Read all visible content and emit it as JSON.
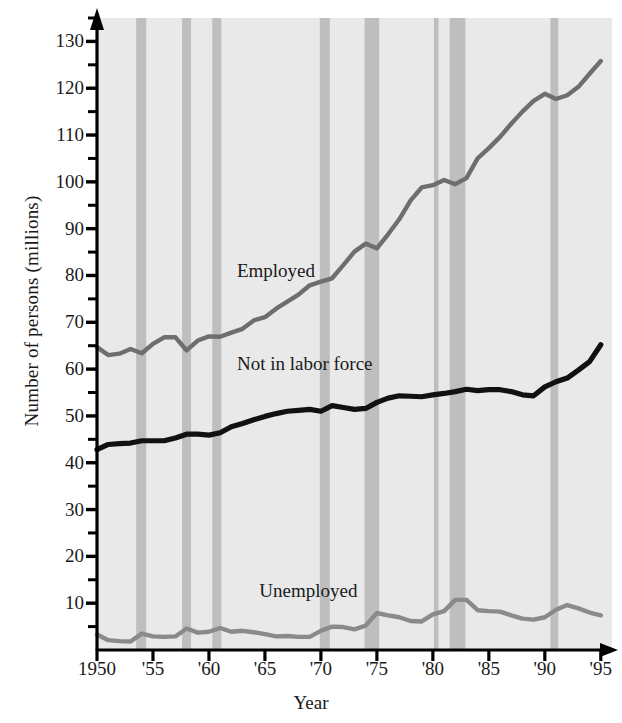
{
  "chart_data": {
    "type": "line",
    "title": "",
    "xlabel": "Year",
    "ylabel": "Number of persons (millions)",
    "xlim": [
      1950,
      1996
    ],
    "ylim": [
      0,
      135
    ],
    "grid": false,
    "legend_position": "inline-annotations",
    "x_tick_labels": [
      "1950",
      "'55",
      "'60",
      "'65",
      "'70",
      "'75",
      "'80",
      "'85",
      "'90",
      "'95"
    ],
    "x_tick_values": [
      1950,
      1955,
      1960,
      1965,
      1970,
      1975,
      1980,
      1985,
      1990,
      1995
    ],
    "y_tick_labels": [
      "10",
      "20",
      "30",
      "40",
      "50",
      "60",
      "70",
      "80",
      "90",
      "100",
      "110",
      "120",
      "130"
    ],
    "y_tick_values": [
      10,
      20,
      30,
      40,
      50,
      60,
      70,
      80,
      90,
      100,
      110,
      120,
      130
    ],
    "y_minor_ticks": [
      5,
      15,
      25,
      35,
      45,
      55,
      65,
      75,
      85,
      95,
      105,
      115,
      125,
      135
    ],
    "x": [
      1950,
      1951,
      1952,
      1953,
      1954,
      1955,
      1956,
      1957,
      1958,
      1959,
      1960,
      1961,
      1962,
      1963,
      1964,
      1965,
      1966,
      1967,
      1968,
      1969,
      1970,
      1971,
      1972,
      1973,
      1974,
      1975,
      1976,
      1977,
      1978,
      1979,
      1980,
      1981,
      1982,
      1983,
      1984,
      1985,
      1986,
      1987,
      1988,
      1989,
      1990,
      1991,
      1992,
      1993,
      1994,
      1995
    ],
    "series": [
      {
        "name": "Employed",
        "color": "#6e6e6e",
        "values": [
          64.7,
          63.0,
          63.3,
          64.3,
          63.4,
          65.4,
          66.8,
          66.8,
          64.0,
          66.1,
          67.0,
          66.9,
          67.8,
          68.6,
          70.4,
          71.1,
          72.9,
          74.4,
          75.9,
          77.9,
          78.7,
          79.4,
          82.2,
          85.1,
          86.8,
          85.8,
          88.8,
          92.0,
          96.0,
          98.8,
          99.3,
          100.4,
          99.5,
          100.8,
          105.0,
          107.2,
          109.6,
          112.4,
          115.0,
          117.3,
          118.8,
          117.7,
          118.5,
          120.3,
          123.1,
          125.8
        ]
      },
      {
        "name": "Not in labor force",
        "color": "#111111",
        "values": [
          42.8,
          43.9,
          44.1,
          44.2,
          44.7,
          44.7,
          44.7,
          45.3,
          46.1,
          46.1,
          45.9,
          46.4,
          47.7,
          48.4,
          49.2,
          49.9,
          50.5,
          51.0,
          51.2,
          51.4,
          51.0,
          52.2,
          51.8,
          51.4,
          51.6,
          52.9,
          53.8,
          54.3,
          54.2,
          54.1,
          54.5,
          54.8,
          55.2,
          55.7,
          55.4,
          55.6,
          55.6,
          55.2,
          54.5,
          54.3,
          56.2,
          57.3,
          58.1,
          59.8,
          61.6,
          65.2
        ]
      },
      {
        "name": "Unemployed",
        "color": "#8a8a8a",
        "values": [
          3.3,
          2.1,
          1.9,
          1.8,
          3.5,
          2.9,
          2.8,
          2.9,
          4.6,
          3.7,
          3.9,
          4.7,
          3.9,
          4.1,
          3.8,
          3.4,
          2.9,
          3.0,
          2.8,
          2.8,
          4.1,
          5.0,
          4.9,
          4.4,
          5.2,
          7.9,
          7.4,
          7.0,
          6.2,
          6.1,
          7.6,
          8.3,
          10.7,
          10.7,
          8.5,
          8.3,
          8.2,
          7.4,
          6.7,
          6.5,
          7.0,
          8.6,
          9.6,
          8.9,
          8.0,
          7.4
        ]
      }
    ],
    "recession_bands": [
      {
        "start": 1953.5,
        "end": 1954.4
      },
      {
        "start": 1957.6,
        "end": 1958.4
      },
      {
        "start": 1960.3,
        "end": 1961.1
      },
      {
        "start": 1969.9,
        "end": 1970.8
      },
      {
        "start": 1973.9,
        "end": 1975.2
      },
      {
        "start": 1980.1,
        "end": 1980.5
      },
      {
        "start": 1981.5,
        "end": 1982.9
      },
      {
        "start": 1990.5,
        "end": 1991.2
      }
    ],
    "band_color": "#bebebe",
    "plot_background": "#e9e9e9",
    "axis_color": "#000000"
  },
  "annotations": [
    {
      "label": "Employed",
      "x": 1962.5,
      "y": 81
    },
    {
      "label": "Not in labor force",
      "x": 1962.5,
      "y": 61
    },
    {
      "label": "Unemployed",
      "x": 1964.5,
      "y": 12.5
    }
  ]
}
